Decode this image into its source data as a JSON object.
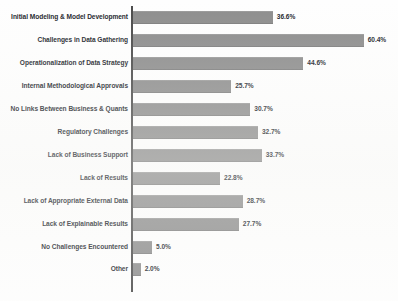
{
  "chart_data": {
    "type": "bar",
    "orientation": "horizontal",
    "title": "",
    "subtitle": "",
    "xlabel": "",
    "ylabel": "",
    "xlim": [
      0,
      65
    ],
    "grid": false,
    "legend": false,
    "value_suffix": "%",
    "bar_color": "#8d8d8d",
    "axis_color": "#4a4a4a",
    "categories": [
      "Initial Modeling & Model Development",
      "Challenges in Data Gathering",
      "Operationalization of Data Strategy",
      "Internal Methodological Approvals",
      "No Links Between Business & Quants",
      "Regulatory Challenges",
      "Lack of Business Support",
      "Lack of Results",
      "Lack of Appropriate External Data",
      "Lack of Explainable Results",
      "No Challenges Encountered",
      "Other"
    ],
    "values": [
      36.6,
      60.4,
      44.6,
      25.7,
      30.7,
      32.7,
      33.7,
      22.8,
      28.7,
      27.7,
      5.0,
      2.0
    ],
    "value_labels": [
      "36.6%",
      "60.4%",
      "44.6%",
      "25.7%",
      "30.7%",
      "32.7%",
      "33.7%",
      "22.8%",
      "28.7%",
      "27.7%",
      "5.0%",
      "2.0%"
    ]
  }
}
